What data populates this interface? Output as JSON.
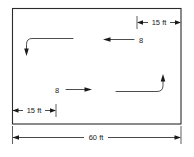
{
  "diagram": {
    "colors": {
      "outline": "#2b2b2b",
      "dimension": "#1a1a1a",
      "flow": "#3a3a3a",
      "background": "#ffffff"
    },
    "room": {
      "name": "room-rectangle",
      "overall_width_label": "60 ft"
    },
    "dimensions": [
      {
        "id": "top-right-offset",
        "label": "15 ft",
        "position": "top-right",
        "style": "double-arrow"
      },
      {
        "id": "bottom-left-offset",
        "label": "15 ft",
        "position": "bottom-left-inside",
        "style": "double-arrow"
      },
      {
        "id": "overall-width",
        "label": "60 ft",
        "position": "bottom-outside",
        "style": "double-arrow"
      }
    ],
    "flow_arrows": [
      {
        "id": "upper-supply-flow",
        "label": "",
        "direction": "left-then-down",
        "position": "upper-left"
      },
      {
        "id": "upper-return-flow",
        "label": "8",
        "direction": "left",
        "position": "upper-middle"
      },
      {
        "id": "lower-supply-flow",
        "label": "8",
        "direction": "right",
        "position": "lower-middle"
      },
      {
        "id": "lower-return-flow",
        "label": "",
        "direction": "right-then-up",
        "position": "lower-right"
      }
    ],
    "labels": {
      "top_right_dim": "15 ft",
      "upper_flow_value": "8",
      "lower_flow_value": "8",
      "bottom_left_dim": "15 ft",
      "overall_dim": "60 ft"
    }
  }
}
